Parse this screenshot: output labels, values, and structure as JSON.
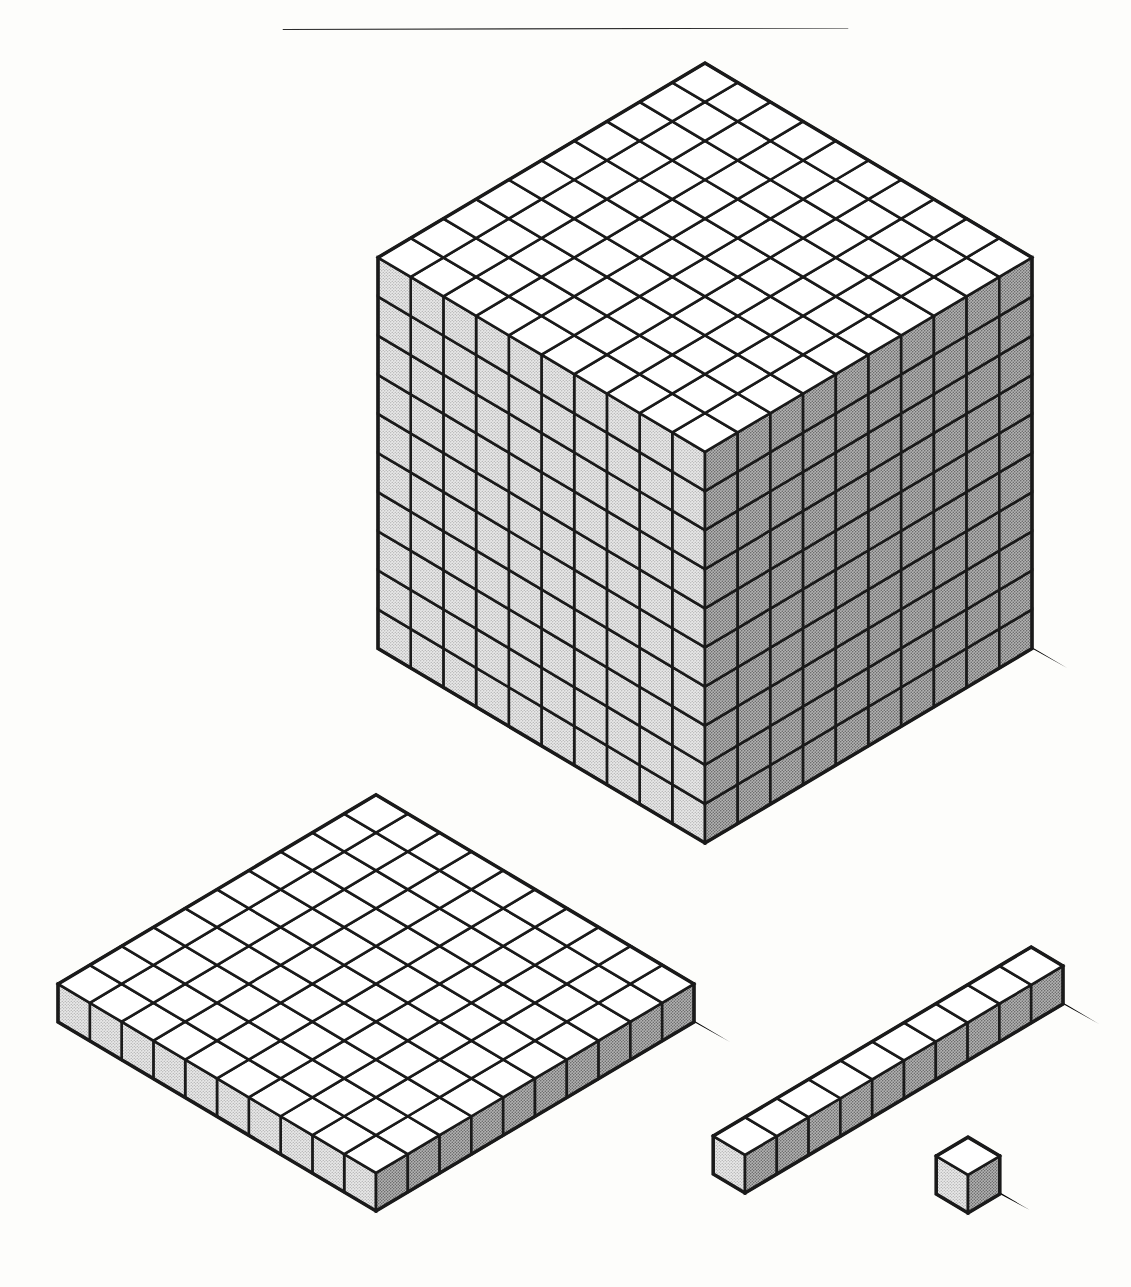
{
  "page": {
    "background_color": "#fdfdfb",
    "rule": {
      "name": "horizontal-rule",
      "color": "#2b2b2b",
      "x1": 0,
      "y1": 31,
      "x2": 1131,
      "y2": 28,
      "thickness": 2.2
    }
  },
  "render": {
    "stroke_color": "#1a1a1a",
    "stroke_width": 2.6,
    "shadow_color": "#000000",
    "face_colors": {
      "top": "#ffffff",
      "left": "#d9d9d9",
      "right": "#a8a8a8"
    },
    "iso": {
      "ux": 32.7,
      "uy": -19.4,
      "vx": -32.7,
      "vy": -19.4,
      "wx": 0,
      "wy": -39.1
    }
  },
  "blocks": [
    {
      "name": "thousand-cube",
      "label": "1000-cube",
      "value": 1000,
      "dims": {
        "x": 10,
        "y": 10,
        "z": 10
      },
      "unit_count": 1000,
      "origin": {
        "x": 705,
        "y": 843
      },
      "cell": 32.7,
      "shadow_offset": {
        "x": 36,
        "y": 20
      }
    },
    {
      "name": "hundred-flat",
      "label": "100-flat",
      "value": 100,
      "dims": {
        "x": 10,
        "y": 10,
        "z": 1
      },
      "unit_count": 100,
      "origin": {
        "x": 376,
        "y": 1211
      },
      "cell": 31.8,
      "shadow_offset": {
        "x": 36,
        "y": 20
      }
    },
    {
      "name": "ten-rod",
      "label": "10-rod",
      "value": 10,
      "dims": {
        "x": 10,
        "y": 1,
        "z": 1
      },
      "unit_count": 10,
      "origin": {
        "x": 745,
        "y": 1193
      },
      "cell": 31.8,
      "shadow_offset": {
        "x": 36,
        "y": 20
      }
    },
    {
      "name": "one-unit-cube",
      "label": "1-unit",
      "value": 1,
      "dims": {
        "x": 1,
        "y": 1,
        "z": 1
      },
      "unit_count": 1,
      "origin": {
        "x": 968,
        "y": 1213
      },
      "cell": 31.8,
      "shadow_offset": {
        "x": 30,
        "y": 16
      }
    }
  ],
  "chart_data": {
    "type": "table",
    "categories": [
      "1000-cube",
      "100-flat",
      "10-rod",
      "1-unit"
    ],
    "values": [
      1000,
      100,
      10,
      1
    ],
    "xlabel": "",
    "ylabel": "",
    "annotations": []
  }
}
